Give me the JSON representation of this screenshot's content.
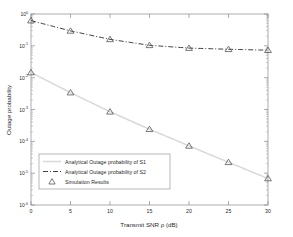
{
  "chart_data": {
    "type": "line",
    "title": "",
    "xlabel": "Transmit SNR ρ (dB)",
    "ylabel": "Outage probability",
    "xlim": [
      0,
      30
    ],
    "ylim": [
      1e-06,
      1
    ],
    "yscale": "log",
    "xscale": "linear",
    "grid": false,
    "legend_position": "lower-left-inside",
    "xticks": [
      0,
      5,
      10,
      15,
      20,
      25,
      30
    ],
    "xticklabels": [
      "0",
      "5",
      "10",
      "15",
      "20",
      "25",
      "30"
    ],
    "yticks": [
      1,
      0.1,
      0.01,
      0.001,
      0.0001,
      1e-05,
      1e-06
    ],
    "yticklabels": [
      "10^0",
      "10^-1",
      "10^-2",
      "10^-3",
      "10^-4",
      "10^-5",
      "10^-6"
    ],
    "yticklabels_mantissa": [
      "10",
      "10",
      "10",
      "10",
      "10",
      "10",
      "10"
    ],
    "yticklabels_exponent": [
      "0",
      "-1",
      "-2",
      "-3",
      "-4",
      "-5",
      "-6"
    ],
    "x": [
      0,
      5,
      10,
      15,
      20,
      25,
      30
    ],
    "series": [
      {
        "name": "Analytical Outage probability of S1",
        "style": "solid",
        "color": "#d9d9d9",
        "values": [
          0.0145,
          0.0034,
          0.00085,
          0.00024,
          7.2e-05,
          2.2e-05,
          6.8e-06
        ]
      },
      {
        "name": "Analytical Outage probability of S2",
        "style": "dashdot",
        "color": "#2a2a2a",
        "values": [
          0.62,
          0.295,
          0.16,
          0.104,
          0.085,
          0.078,
          0.073
        ]
      },
      {
        "name": "Simulation Results",
        "style": "markers",
        "marker": "triangle",
        "color": "#555555",
        "values_s1": [
          0.0145,
          0.0034,
          0.00085,
          0.00024,
          7.2e-05,
          2.2e-05,
          6.8e-06
        ],
        "values_s2": [
          0.62,
          0.295,
          0.16,
          0.104,
          0.085,
          0.078,
          0.073
        ]
      }
    ]
  },
  "legend": {
    "entries": [
      {
        "label": "Analytical Outage probability of S1",
        "marker": "line-solid-lightgray"
      },
      {
        "label": "Analytical Outage probability of S2",
        "marker": "line-dashdot-dark"
      },
      {
        "label": "Simulation Results",
        "marker": "triangle-open"
      }
    ]
  },
  "axes": {
    "xlabel": "Transmit SNR ρ (dB)",
    "ylabel": "Outage probability",
    "x_tick_labels": [
      "0",
      "5",
      "10",
      "15",
      "20",
      "25",
      "30"
    ],
    "y_tick_exponents": [
      "0",
      "-1",
      "-2",
      "-3",
      "-4",
      "-5",
      "-6"
    ],
    "y_tick_base": "10"
  },
  "colors": {
    "series_s1": "#d9d9d9",
    "series_s2": "#2a2a2a",
    "marker": "#555555",
    "axis": "#8a8a8a",
    "text": "#2a2a2a",
    "background": "#ffffff",
    "legend_border": "#9a9a9a"
  }
}
